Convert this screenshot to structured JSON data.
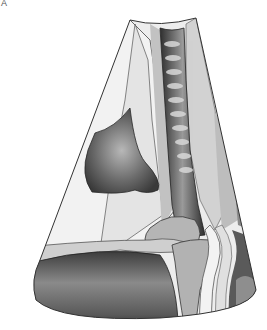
{
  "figure": {
    "panel_label": "A",
    "type": "anatomical ultrasound sector illustration",
    "colors": {
      "background": "#ffffff",
      "outline": "#333333",
      "light_tissue": "#ececec",
      "mid_tissue": "#c4c4c4",
      "dark_region": "#4a4a4a"
    }
  }
}
